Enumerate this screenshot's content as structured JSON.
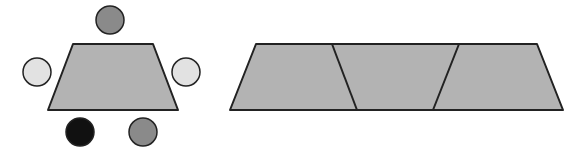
{
  "colors": {
    "background": "#ffffff",
    "stroke": "#222222",
    "trapezoid_fill": "#b3b3b3",
    "seat_medium": "#8a8a8a",
    "seat_light": "#e2e2e2",
    "seat_dark": "#111111"
  },
  "left_figure": {
    "description": "Single trapezoid table with five seats",
    "table": {
      "points": "73,44 153,44 178,110 48,110"
    },
    "seats": [
      {
        "name": "top",
        "cx": 110,
        "cy": 20,
        "r": 14,
        "tone": "seat_medium"
      },
      {
        "name": "left",
        "cx": 37,
        "cy": 72,
        "r": 14,
        "tone": "seat_light"
      },
      {
        "name": "right",
        "cx": 186,
        "cy": 72,
        "r": 14,
        "tone": "seat_light"
      },
      {
        "name": "bottom-left",
        "cx": 80,
        "cy": 132,
        "r": 14,
        "tone": "seat_dark"
      },
      {
        "name": "bottom-right",
        "cx": 143,
        "cy": 132,
        "r": 14,
        "tone": "seat_medium"
      }
    ]
  },
  "right_figure": {
    "description": "Three trapezoids joined in a row (alternating orientation)",
    "outline": {
      "points": "256,44 537,44 563,110 230,110"
    },
    "dividers": [
      {
        "x1": 332,
        "y1": 44,
        "x2": 357,
        "y2": 110
      },
      {
        "x1": 459,
        "y1": 44,
        "x2": 433,
        "y2": 110
      }
    ]
  }
}
